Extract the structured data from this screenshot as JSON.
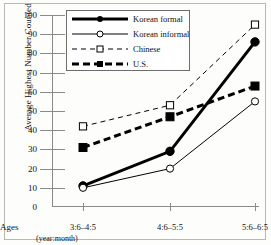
{
  "chart_data": {
    "type": "line",
    "title": "",
    "xlabel": "Ages (year:month)",
    "ylabel": "Average Highest Number Counted",
    "categories": [
      "3:6–4:5",
      "4:6–5:5",
      "5:6–6:5"
    ],
    "ylim": [
      0,
      100
    ],
    "ytick_labels": [
      "0",
      "10",
      "20",
      "30",
      "40",
      "50",
      "60",
      "70",
      "80",
      "90",
      "100"
    ],
    "ytick_values": [
      0,
      10,
      20,
      30,
      40,
      50,
      60,
      70,
      80,
      90,
      100
    ],
    "grid": false,
    "legend_position": "top-left-inside",
    "series": [
      {
        "name": "Korean formal",
        "values": [
          11,
          29,
          86
        ],
        "color": "#000000",
        "linestyle": "solid",
        "linewidth": 3,
        "marker": "filled-circle"
      },
      {
        "name": "Korean informal",
        "values": [
          10,
          20,
          55
        ],
        "color": "#000000",
        "linestyle": "solid",
        "linewidth": 1,
        "marker": "open-circle"
      },
      {
        "name": "Chinese",
        "values": [
          42,
          53,
          95
        ],
        "color": "#000000",
        "linestyle": "dashed",
        "linewidth": 1,
        "marker": "open-square"
      },
      {
        "name": "U.S.",
        "values": [
          31,
          47,
          63
        ],
        "color": "#000000",
        "linestyle": "dashed",
        "linewidth": 3,
        "marker": "filled-square"
      }
    ]
  },
  "axes": {
    "ages_prefix": "Ages",
    "unit_note": "(year:month)"
  }
}
